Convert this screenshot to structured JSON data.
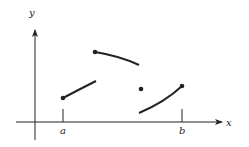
{
  "diagram": {
    "type": "piecewise function graph with discontinuities",
    "axis_labels": {
      "x": "x",
      "y": "y"
    },
    "tick_labels": {
      "a": "a",
      "b": "b"
    },
    "color": "#222222"
  }
}
